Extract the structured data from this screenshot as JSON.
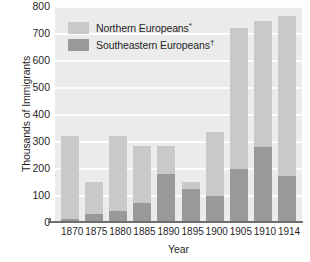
{
  "chart_data": {
    "type": "bar",
    "stacked": true,
    "title": "",
    "xlabel": "Year",
    "ylabel": "Thousands of Immigrants",
    "categories": [
      "1870",
      "1875",
      "1880",
      "1885",
      "1890",
      "1895",
      "1900",
      "1905",
      "1910",
      "1914"
    ],
    "series": [
      {
        "name": "Southeastern Europeans",
        "marker": "†",
        "color": "#999999",
        "values": [
          12,
          30,
          42,
          70,
          178,
          122,
          97,
          198,
          278,
          172
        ]
      },
      {
        "name": "Northern Europeans",
        "marker": "*",
        "color": "#c9c9c9",
        "values": [
          308,
          118,
          278,
          213,
          105,
          26,
          238,
          520,
          465,
          590
        ]
      }
    ],
    "totals": [
      320,
      148,
      320,
      283,
      283,
      148,
      335,
      718,
      743,
      762
    ],
    "ylim": [
      0,
      800
    ],
    "ytick_values": [
      0,
      100,
      200,
      300,
      400,
      500,
      600,
      700,
      800
    ],
    "ytick_labels": [
      "0",
      "100",
      "200",
      "300",
      "400",
      "500",
      "600",
      "700",
      "800"
    ],
    "grid": true,
    "grid_color": "#fdfdfd",
    "plot_background": "#ebebeb",
    "legend_position": "upper-left-inside"
  },
  "legend": {
    "entries": [
      {
        "label": "Northern Europeans",
        "marker": "*",
        "swatch_color": "#c9c9c9"
      },
      {
        "label": "Southeastern Europeans",
        "marker": "†",
        "swatch_color": "#999999"
      }
    ]
  },
  "axes": {
    "y_title": "Thousands of Immigrants",
    "x_title": "Year"
  }
}
